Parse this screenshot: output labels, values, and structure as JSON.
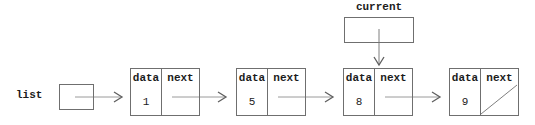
{
  "diagram": {
    "list_label": "list",
    "current_label": "current",
    "cell_headers": {
      "data": "data",
      "next": "next"
    },
    "nodes": [
      {
        "data": "1",
        "next": "arrow-to-next-node"
      },
      {
        "data": "5",
        "next": "arrow-to-next-node"
      },
      {
        "data": "8",
        "next": "arrow-to-next-node"
      },
      {
        "data": "9",
        "next": "null-diagonal-slash"
      }
    ],
    "pointers": {
      "list_points_to_node_index": 0,
      "current_points_to_node_index": 2
    },
    "colors": {
      "background": "#ffffff",
      "border": "#6f6f6f",
      "arrow_line": "#9a9a9a",
      "arrow_head": "#5f5f5f",
      "text": "#1c1c1c"
    }
  }
}
